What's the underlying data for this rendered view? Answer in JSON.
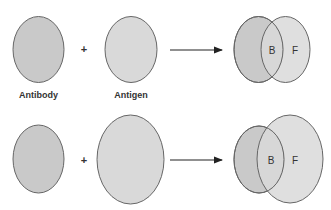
{
  "diagram": {
    "colors": {
      "fill_dark": "#c9c9c9",
      "fill_light": "#d9d9d9",
      "stroke": "#666666",
      "text": "#333333",
      "arrow": "#222222"
    },
    "row1": {
      "antibody_label": "Antibody",
      "plus": "+",
      "antigen_label": "Antigen",
      "result": {
        "bound_label": "B",
        "free_label": "F"
      }
    },
    "row2": {
      "plus": "+",
      "result": {
        "bound_label": "B",
        "free_label": "F"
      }
    }
  }
}
